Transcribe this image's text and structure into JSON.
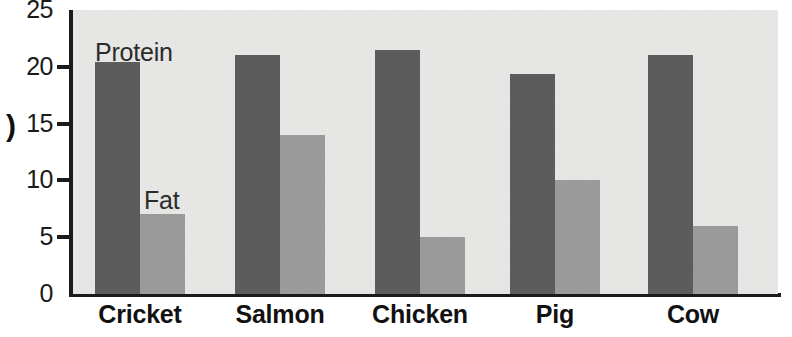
{
  "chart_data": {
    "type": "bar",
    "title": "",
    "subtitle": "",
    "xlabel": "",
    "ylabel": ")",
    "ylabel_note": "y-axis title is cropped at the left edge of the image; only a closing parenthesis is visible",
    "categories": [
      "Cricket",
      "Salmon",
      "Chicken",
      "Pig",
      "Cow"
    ],
    "series": [
      {
        "name": "Protein",
        "color": "#5b5b5b",
        "values": [
          20.4,
          21.0,
          21.5,
          19.4,
          21.0
        ]
      },
      {
        "name": "Fat",
        "color": "#9b9b9b",
        "values": [
          7.0,
          14.0,
          5.0,
          10.0,
          6.0
        ]
      }
    ],
    "ylim": [
      0,
      25
    ],
    "yticks": [
      0,
      5,
      10,
      15,
      20,
      25
    ],
    "ytick_labels": [
      "0",
      "5",
      "10",
      "15",
      "20",
      "25"
    ],
    "grid": false,
    "legend": "in-plot annotations above first group bars",
    "annotations": [
      {
        "text": "Protein",
        "series": "Protein",
        "near_category": "Cricket"
      },
      {
        "text": "Fat",
        "series": "Fat",
        "near_category": "Cricket"
      }
    ]
  },
  "colors": {
    "protein_bar": "#5b5b5b",
    "fat_bar": "#9b9b9b",
    "plot_background": "#e7e7e5",
    "page_background": "#ffffff",
    "axis": "#1b1b1b",
    "tick_label": "#1b1b1b",
    "category_label": "#111111"
  }
}
